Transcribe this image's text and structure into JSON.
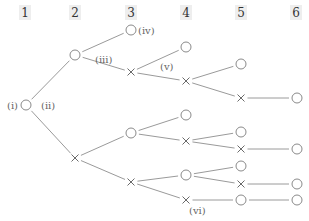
{
  "headers": [
    {
      "label": "1",
      "x": 25
    },
    {
      "label": "2",
      "x": 75
    },
    {
      "label": "3",
      "x": 131
    },
    {
      "label": "4",
      "x": 186
    },
    {
      "label": "5",
      "x": 241
    },
    {
      "label": "6",
      "x": 296
    }
  ],
  "labels": [
    {
      "text": "(i)",
      "x": 7,
      "y": 109
    },
    {
      "text": "(ii)",
      "x": 41,
      "y": 109
    },
    {
      "text": "(iii)",
      "x": 95,
      "y": 63
    },
    {
      "text": "(iv)",
      "x": 138,
      "y": 34
    },
    {
      "text": "(v)",
      "x": 160,
      "y": 70
    },
    {
      "text": "(vi)",
      "x": 189,
      "y": 214
    }
  ],
  "symbols": {
    "circle": "○",
    "cross": "×"
  },
  "nodes": [
    {
      "id": "n1",
      "type": "o",
      "x": 26,
      "y": 105
    },
    {
      "id": "n2a",
      "type": "o",
      "x": 75,
      "y": 55
    },
    {
      "id": "n2b",
      "type": "x",
      "x": 75,
      "y": 158
    },
    {
      "id": "n3a",
      "type": "o",
      "x": 131,
      "y": 30
    },
    {
      "id": "n3b",
      "type": "x",
      "x": 131,
      "y": 72
    },
    {
      "id": "n3c",
      "type": "o",
      "x": 131,
      "y": 133
    },
    {
      "id": "n3d",
      "type": "x",
      "x": 131,
      "y": 182
    },
    {
      "id": "n4a",
      "type": "o",
      "x": 186,
      "y": 47
    },
    {
      "id": "n4b",
      "type": "x",
      "x": 186,
      "y": 81
    },
    {
      "id": "n4c",
      "type": "o",
      "x": 186,
      "y": 115
    },
    {
      "id": "n4d",
      "type": "x",
      "x": 186,
      "y": 141
    },
    {
      "id": "n4e",
      "type": "o",
      "x": 186,
      "y": 175
    },
    {
      "id": "n4f",
      "type": "x",
      "x": 186,
      "y": 200
    },
    {
      "id": "n5a",
      "type": "o",
      "x": 241,
      "y": 64
    },
    {
      "id": "n5b",
      "type": "x",
      "x": 241,
      "y": 98
    },
    {
      "id": "n5c",
      "type": "o",
      "x": 241,
      "y": 132
    },
    {
      "id": "n5d",
      "type": "x",
      "x": 241,
      "y": 149
    },
    {
      "id": "n5e",
      "type": "o",
      "x": 241,
      "y": 166
    },
    {
      "id": "n5f",
      "type": "x",
      "x": 241,
      "y": 184
    },
    {
      "id": "n5g",
      "type": "o",
      "x": 241,
      "y": 200
    },
    {
      "id": "n6a",
      "type": "o",
      "x": 297,
      "y": 98
    },
    {
      "id": "n6b",
      "type": "o",
      "x": 297,
      "y": 149
    },
    {
      "id": "n6c",
      "type": "o",
      "x": 297,
      "y": 184
    },
    {
      "id": "n6d",
      "type": "o",
      "x": 297,
      "y": 200
    }
  ],
  "edges": [
    [
      "n1",
      "n2a"
    ],
    [
      "n1",
      "n2b"
    ],
    [
      "n2a",
      "n3a"
    ],
    [
      "n2a",
      "n3b"
    ],
    [
      "n2b",
      "n3c"
    ],
    [
      "n2b",
      "n3d"
    ],
    [
      "n3b",
      "n4a"
    ],
    [
      "n3b",
      "n4b"
    ],
    [
      "n3c",
      "n4c"
    ],
    [
      "n3c",
      "n4d"
    ],
    [
      "n3d",
      "n4e"
    ],
    [
      "n3d",
      "n4f"
    ],
    [
      "n4b",
      "n5a"
    ],
    [
      "n4b",
      "n5b"
    ],
    [
      "n4d",
      "n5c"
    ],
    [
      "n4d",
      "n5d"
    ],
    [
      "n4e",
      "n5e"
    ],
    [
      "n4e",
      "n5f"
    ],
    [
      "n4f",
      "n5g"
    ],
    [
      "n5b",
      "n6a"
    ],
    [
      "n5d",
      "n6b"
    ],
    [
      "n5f",
      "n6c"
    ],
    [
      "n5g",
      "n6d"
    ]
  ]
}
